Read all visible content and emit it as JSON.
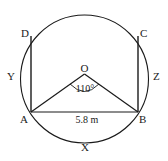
{
  "diagram": {
    "type": "geometry",
    "colors": {
      "stroke": "#1a1a1a",
      "background": "#ffffff"
    },
    "points": {
      "O": "O",
      "A": "A",
      "B": "B",
      "C": "C",
      "D": "D"
    },
    "arc_labels": {
      "X": "X",
      "Y": "Y",
      "Z": "Z"
    },
    "angle_label": "110°",
    "length_label": "5.8 m"
  }
}
